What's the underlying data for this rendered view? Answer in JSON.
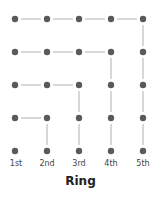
{
  "title": "Ring",
  "columns": [
    "1st",
    "2nd",
    "3rd",
    "4th",
    "5th"
  ],
  "rows": 5,
  "colors": {
    "dot": "#5a5a5a",
    "line": "#bdbdbd"
  },
  "edges": [
    [
      [
        0,
        0
      ],
      [
        1,
        0
      ]
    ],
    [
      [
        1,
        0
      ],
      [
        2,
        0
      ]
    ],
    [
      [
        2,
        0
      ],
      [
        3,
        0
      ]
    ],
    [
      [
        3,
        0
      ],
      [
        4,
        0
      ]
    ],
    [
      [
        4,
        0
      ],
      [
        4,
        1
      ]
    ],
    [
      [
        4,
        1
      ],
      [
        4,
        2
      ]
    ],
    [
      [
        4,
        2
      ],
      [
        4,
        3
      ]
    ],
    [
      [
        4,
        3
      ],
      [
        4,
        4
      ]
    ],
    [
      [
        0,
        1
      ],
      [
        1,
        1
      ]
    ],
    [
      [
        1,
        1
      ],
      [
        2,
        1
      ]
    ],
    [
      [
        2,
        1
      ],
      [
        3,
        1
      ]
    ],
    [
      [
        3,
        1
      ],
      [
        3,
        2
      ]
    ],
    [
      [
        3,
        2
      ],
      [
        3,
        3
      ]
    ],
    [
      [
        3,
        3
      ],
      [
        3,
        4
      ]
    ],
    [
      [
        0,
        2
      ],
      [
        1,
        2
      ]
    ],
    [
      [
        1,
        2
      ],
      [
        2,
        2
      ]
    ],
    [
      [
        2,
        2
      ],
      [
        2,
        3
      ]
    ],
    [
      [
        2,
        3
      ],
      [
        2,
        4
      ]
    ],
    [
      [
        0,
        3
      ],
      [
        1,
        3
      ]
    ],
    [
      [
        1,
        3
      ],
      [
        1,
        4
      ]
    ]
  ]
}
